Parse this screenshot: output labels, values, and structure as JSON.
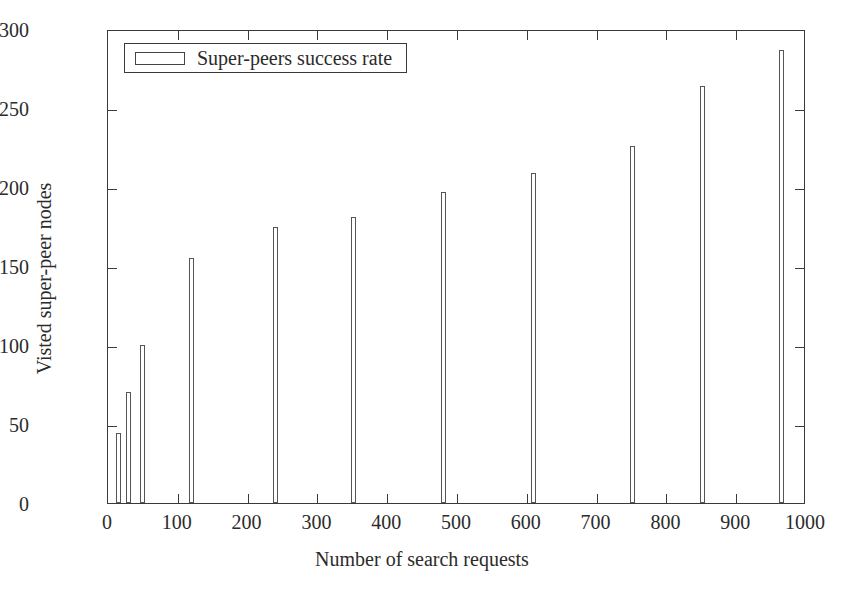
{
  "chart_data": {
    "type": "bar",
    "title": "",
    "xlabel": "Number of search requests",
    "ylabel": "Visted super-peer nodes",
    "xlim": [
      0,
      1000
    ],
    "ylim": [
      0,
      300
    ],
    "xticks": [
      0,
      100,
      200,
      300,
      400,
      500,
      600,
      700,
      800,
      900,
      1000
    ],
    "yticks": [
      0,
      50,
      100,
      150,
      200,
      250,
      300
    ],
    "grid": false,
    "legend_position": "top-left",
    "series": [
      {
        "name": "Super-peers success rate",
        "x": [
          15,
          30,
          50,
          120,
          240,
          352,
          480,
          610,
          752,
          852,
          965
        ],
        "values": [
          44,
          70,
          100,
          155,
          175,
          181,
          197,
          209,
          226,
          264,
          287
        ]
      }
    ],
    "bar_fill_color": "#ffffff",
    "bar_edge_color": "#555555",
    "axis_color": "#3a3a3a"
  },
  "legend": {
    "entries": [
      {
        "label": "Super-peers success rate",
        "swatch": "open-rectangle"
      }
    ]
  },
  "axes": {
    "x_title": "Number of search requests",
    "y_title": "Visted super-peer nodes",
    "x_tick_labels": [
      "0",
      "100",
      "200",
      "300",
      "400",
      "500",
      "600",
      "700",
      "800",
      "900",
      "1000"
    ],
    "y_tick_labels": [
      "0",
      "50",
      "100",
      "150",
      "200",
      "250",
      "300"
    ]
  }
}
